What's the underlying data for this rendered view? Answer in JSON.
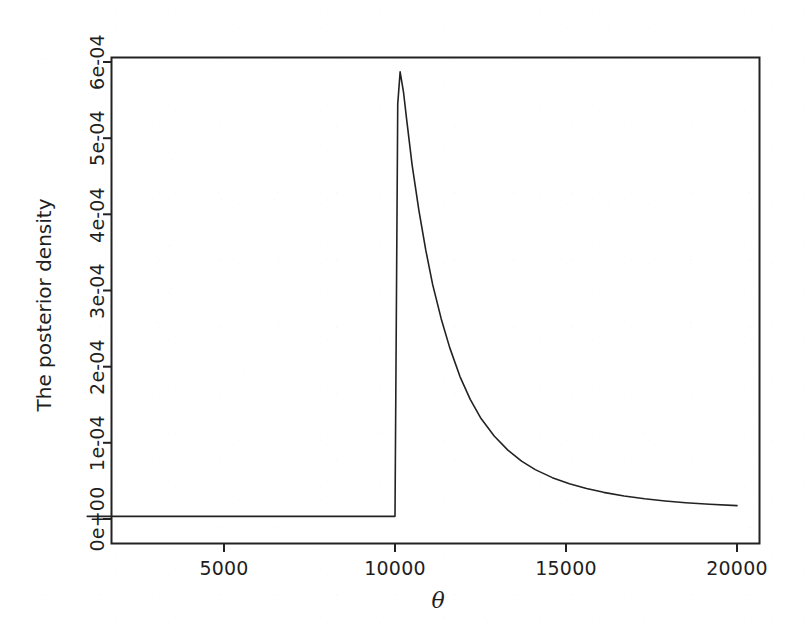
{
  "chart_data": {
    "type": "line",
    "title": "",
    "subtitle": "",
    "xlabel": "θ",
    "ylabel": "The posterior density",
    "xlim": [
      700,
      20600
    ],
    "ylim": [
      -3.15e-05,
      0.00063
    ],
    "grid": false,
    "legend": null,
    "x_ticks": [
      5000,
      10000,
      15000,
      20000
    ],
    "x_tick_labels": [
      "5000",
      "10000",
      "15000",
      "20000"
    ],
    "y_ticks": [
      0.0,
      0.0001,
      0.0002,
      0.0003,
      0.0004,
      0.0005,
      0.0006
    ],
    "y_tick_labels": [
      "0e+00",
      "1e-04",
      "2e-04",
      "3e-04",
      "4e-04",
      "5e-04",
      "6e-04"
    ],
    "line_color": "#222222",
    "line_width": 1.4,
    "box_color": "#222222",
    "background": "#ffffff",
    "annotations": [],
    "peak": {
      "x": 10150,
      "y": 0.000587
    },
    "jump": {
      "x": 10000,
      "y_from": 3.5e-06,
      "y_to": 0.000545
    },
    "series": [
      {
        "name": "posterior density",
        "x": [
          1000,
          1500,
          2000,
          2500,
          3000,
          3500,
          4000,
          4500,
          5000,
          5500,
          6000,
          6500,
          7000,
          7500,
          8000,
          8500,
          9000,
          9500,
          9900,
          9995,
          10000,
          10080,
          10150,
          10250,
          10350,
          10500,
          10700,
          10900,
          11100,
          11350,
          11600,
          11900,
          12200,
          12500,
          12900,
          13300,
          13700,
          14100,
          14600,
          15100,
          15600,
          16100,
          16700,
          17300,
          17900,
          18500,
          19200,
          20000
        ],
        "y": [
          3.5e-06,
          3.5e-06,
          3.5e-06,
          3.5e-06,
          3.5e-06,
          3.5e-06,
          3.5e-06,
          3.5e-06,
          3.5e-06,
          3.5e-06,
          3.5e-06,
          3.5e-06,
          3.5e-06,
          3.5e-06,
          3.5e-06,
          3.5e-06,
          3.5e-06,
          3.5e-06,
          3.5e-06,
          3.5e-06,
          3.5e-06,
          0.000545,
          0.000587,
          0.00056,
          0.000521,
          0.000465,
          0.000405,
          0.000353,
          0.000308,
          0.000263,
          0.000225,
          0.000187,
          0.000157,
          0.000133,
          0.000109,
          9.05e-05,
          7.6e-05,
          6.48e-05,
          5.43e-05,
          4.63e-05,
          4e-05,
          3.5e-05,
          3.02e-05,
          2.65e-05,
          2.37e-05,
          2.14e-05,
          1.93e-05,
          1.75e-05
        ]
      }
    ]
  },
  "figure": {
    "ylabel": "The posterior density",
    "xlabel": "θ",
    "x_tick_labels": [
      "5000",
      "10000",
      "15000",
      "20000"
    ],
    "y_tick_labels": [
      "0e+00",
      "1e-04",
      "2e-04",
      "3e-04",
      "4e-04",
      "5e-04",
      "6e-04"
    ]
  }
}
